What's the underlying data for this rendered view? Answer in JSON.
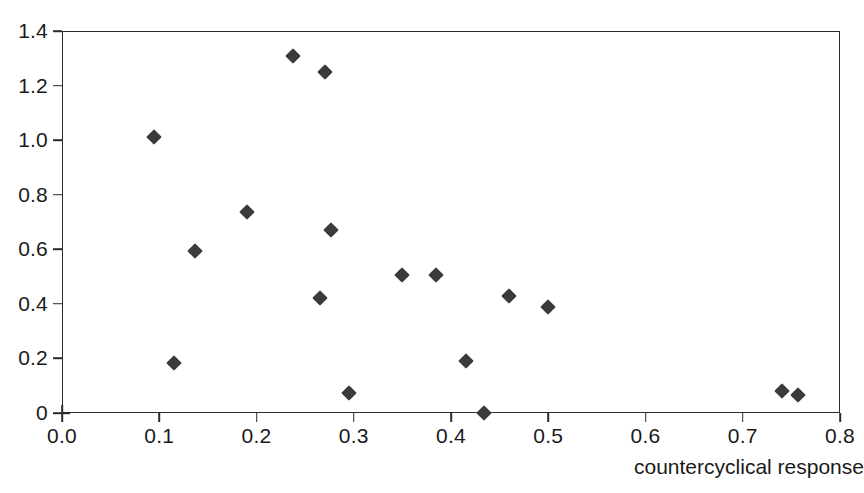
{
  "chart_data": {
    "type": "scatter",
    "title": "",
    "xlabel": "countercyclical response",
    "ylabel": "",
    "xlim": [
      0.0,
      0.8
    ],
    "ylim": [
      0.0,
      1.4
    ],
    "grid": false,
    "legend": null,
    "marker": {
      "shape": "diamond",
      "color": "#3b3b3b",
      "size_px": 11
    },
    "xticks": [
      0.0,
      0.1,
      0.2,
      0.3,
      0.4,
      0.5,
      0.6,
      0.7,
      0.8
    ],
    "xticklabels": [
      "0.0",
      "0.1",
      "0.2",
      "0.3",
      "0.4",
      "0.5",
      "0.6",
      "0.7",
      "0.8"
    ],
    "yticks": [
      0.0,
      0.2,
      0.4,
      0.6,
      0.8,
      1.0,
      1.2,
      1.4
    ],
    "yticklabels": [
      "0",
      "0.2",
      "0.4",
      "0.6",
      "0.8",
      "1.0",
      "1.2",
      "1.4"
    ],
    "series": [
      {
        "name": "observations",
        "points": [
          {
            "x": 0.095,
            "y": 1.01
          },
          {
            "x": 0.115,
            "y": 0.185
          },
          {
            "x": 0.137,
            "y": 0.595
          },
          {
            "x": 0.19,
            "y": 0.735
          },
          {
            "x": 0.238,
            "y": 1.31
          },
          {
            "x": 0.265,
            "y": 0.42
          },
          {
            "x": 0.27,
            "y": 1.25
          },
          {
            "x": 0.277,
            "y": 0.67
          },
          {
            "x": 0.295,
            "y": 0.072
          },
          {
            "x": 0.35,
            "y": 0.505
          },
          {
            "x": 0.385,
            "y": 0.505
          },
          {
            "x": 0.415,
            "y": 0.19
          },
          {
            "x": 0.434,
            "y": 0.0
          },
          {
            "x": 0.46,
            "y": 0.43
          },
          {
            "x": 0.5,
            "y": 0.39
          },
          {
            "x": 0.74,
            "y": 0.08
          },
          {
            "x": 0.757,
            "y": 0.065
          }
        ]
      }
    ]
  }
}
